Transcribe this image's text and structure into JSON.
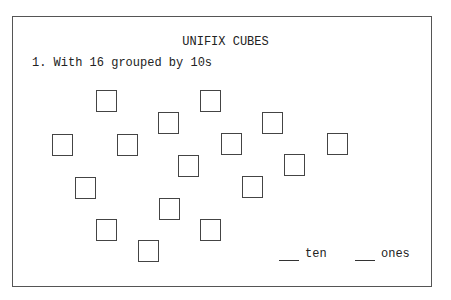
{
  "worksheet": {
    "title": "UNIFIX CUBES",
    "question": "1. With 16 grouped by 10s",
    "cube_count": 16,
    "cubes": [
      {
        "x": 96,
        "y": 90
      },
      {
        "x": 200,
        "y": 90
      },
      {
        "x": 158,
        "y": 112
      },
      {
        "x": 262,
        "y": 112
      },
      {
        "x": 52,
        "y": 134
      },
      {
        "x": 117,
        "y": 134
      },
      {
        "x": 221,
        "y": 133
      },
      {
        "x": 327,
        "y": 133
      },
      {
        "x": 178,
        "y": 155
      },
      {
        "x": 284,
        "y": 154
      },
      {
        "x": 75,
        "y": 177
      },
      {
        "x": 242,
        "y": 176
      },
      {
        "x": 159,
        "y": 198
      },
      {
        "x": 96,
        "y": 219
      },
      {
        "x": 200,
        "y": 219
      },
      {
        "x": 138,
        "y": 240
      }
    ],
    "answer_tens_label": "ten",
    "answer_ones_label": "ones"
  }
}
